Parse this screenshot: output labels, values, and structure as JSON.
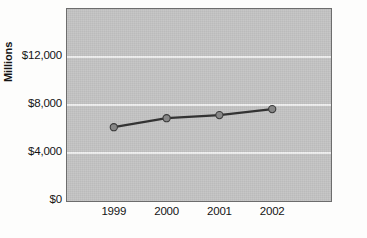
{
  "chart_data": {
    "type": "line",
    "title": "",
    "subtitle": "",
    "xlabel": "",
    "ylabel": "Millions",
    "categories": [
      "1999",
      "2000",
      "2001",
      "2002"
    ],
    "series": [
      {
        "name": "Millions",
        "values": [
          6150,
          6900,
          7160,
          7660
        ]
      }
    ],
    "ylim": [
      0,
      16000
    ],
    "ytick_values": [
      0,
      4000,
      8000,
      12000
    ],
    "ytick_labels": [
      "$0",
      "$4,000",
      "$8,000",
      "$12,000"
    ],
    "xtick_labels": [
      "1999",
      "2000",
      "2001",
      "2002"
    ],
    "grid": true,
    "grid_axis": "y",
    "legend": false,
    "legend_position": "none",
    "annotations": [],
    "colors": {
      "plot_background": "#c3c3c3",
      "plot_border": "#6d6d6d",
      "gridline": "#efefef",
      "line": "#333333",
      "marker_fill": "#878787",
      "marker_stroke": "#3b3b3b",
      "text": "#141414",
      "figure_background": "#fdfdfc"
    }
  }
}
